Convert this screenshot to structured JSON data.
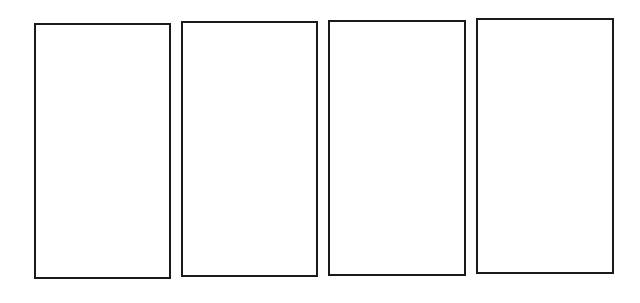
{
  "diagram": {
    "border_color": "#1a1a1a",
    "panels": [
      {
        "label": "",
        "x": 34,
        "y": 23,
        "w": 137,
        "h": 256
      },
      {
        "label": "",
        "x": 181,
        "y": 21,
        "w": 137,
        "h": 256
      },
      {
        "label": "",
        "x": 328,
        "y": 20,
        "w": 138,
        "h": 256
      },
      {
        "label": "",
        "x": 476,
        "y": 18,
        "w": 138,
        "h": 256
      }
    ]
  }
}
